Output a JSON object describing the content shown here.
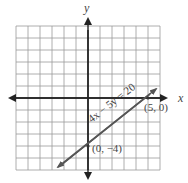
{
  "axes": {
    "x_label": "x",
    "y_label": "y"
  },
  "grid": {
    "x_min": -6,
    "x_max": 6,
    "y_min": -6,
    "y_max": 6,
    "step": 1
  },
  "line": {
    "equation": "4x − 5y = 20",
    "color": "#555555"
  },
  "points": [
    {
      "label": "(5, 0)",
      "x": 5,
      "y": 0
    },
    {
      "label": "(0, −4)",
      "x": 0,
      "y": -4
    }
  ]
}
